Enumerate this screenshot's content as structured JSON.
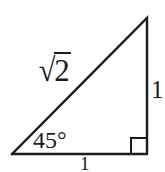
{
  "figure": {
    "kind": "geometry-diagram",
    "background_color": "#fefefe",
    "stroke_color": "#1c1c1c",
    "stroke_width": 2
  },
  "labels": {
    "hypotenuse_radical_sign": "√",
    "hypotenuse_radicand": "2",
    "hypotenuse_full": "√2",
    "angle": "45°",
    "leg_vertical": "1",
    "leg_base": "1"
  },
  "geometry": {
    "vertices": {
      "left": [
        12,
        154
      ],
      "apex": [
        147,
        18
      ],
      "right": [
        147,
        154
      ]
    },
    "right_angle_marker": {
      "x": 131,
      "y": 138,
      "size": 16
    }
  }
}
